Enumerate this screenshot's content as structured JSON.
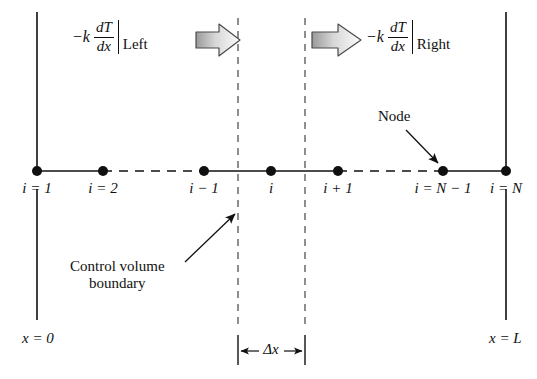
{
  "figure": {
    "background_color": "#ffffff",
    "line_color": "#101010",
    "arrow_fill_light": "#f2f2f2",
    "arrow_fill_dark": "#9a9a9a"
  },
  "flux_left": {
    "minus_k": "−k",
    "numerator": "dT",
    "denominator": "dx",
    "side": "Left"
  },
  "flux_right": {
    "minus_k": "−k",
    "numerator": "dT",
    "denominator": "dx",
    "side": "Right"
  },
  "nodes": [
    {
      "label": "i = 1",
      "x": 37
    },
    {
      "label": "i = 2",
      "x": 103
    },
    {
      "label": "i − 1",
      "x": 204
    },
    {
      "label": "i",
      "x": 271
    },
    {
      "label": "i + 1",
      "x": 338
    },
    {
      "label": "i = N − 1",
      "x": 443
    },
    {
      "label": "i = N",
      "x": 506
    }
  ],
  "annotations": {
    "node_callout": "Node",
    "control_volume_line1": "Control volume",
    "control_volume_line2": "boundary"
  },
  "axis": {
    "left_label": "x = 0",
    "right_label": "x = L",
    "spacing_label": "Δx"
  },
  "icons": {
    "flux_arrow_left": "right-arrow-icon",
    "flux_arrow_right": "right-arrow-icon",
    "node_pointer": "arrow-pointer-icon",
    "cv_pointer": "arrow-pointer-icon"
  }
}
